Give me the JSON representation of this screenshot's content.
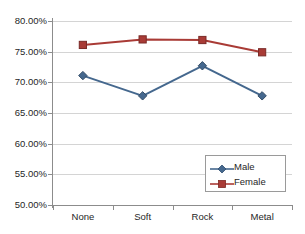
{
  "chart_data": {
    "type": "line",
    "title": "",
    "subtitle": "",
    "xlabel": "",
    "ylabel": "",
    "categories": [
      "None",
      "Soft",
      "Rock",
      "Metal"
    ],
    "series": [
      {
        "name": "Male",
        "color": "#45688E",
        "marker": "diamond",
        "values": [
          71.1,
          67.8,
          72.7,
          67.8
        ]
      },
      {
        "name": "Female",
        "color": "#A93B36",
        "marker": "square",
        "values": [
          76.1,
          77.0,
          76.9,
          74.9
        ]
      }
    ],
    "ylim": [
      50,
      80
    ],
    "ytick_values": [
      50,
      55,
      60,
      65,
      70,
      75,
      80
    ],
    "ytick_labels": [
      "50.00%",
      "55.00%",
      "60.00%",
      "65.00%",
      "70.00%",
      "75.00%",
      "80.00%"
    ],
    "grid": true,
    "grid_axis": "y",
    "grid_color": "#D4D4D4",
    "legend_position": "lower-right",
    "legend_entries": [
      "Male",
      "Female"
    ],
    "axis_color": "#8C8C8C",
    "background": "#FFFFFF",
    "text_color": "#262626"
  }
}
